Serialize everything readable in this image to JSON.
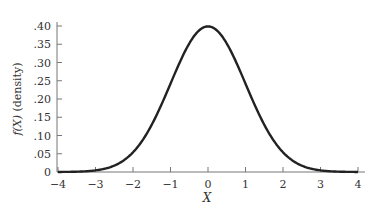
{
  "chart_data": {
    "type": "line",
    "title": "",
    "xlabel": "X",
    "ylabel": "f(X) (density)",
    "xlim": [
      -4,
      4
    ],
    "ylim": [
      0,
      0.4
    ],
    "x_ticks": [
      "−4",
      "−3",
      "−2",
      "−1",
      "0",
      "1",
      "2",
      "3",
      "4"
    ],
    "y_ticks": [
      "0",
      ".05",
      ".10",
      ".15",
      ".20",
      ".25",
      ".30",
      ".35",
      ".40"
    ],
    "grid": false,
    "legend": null,
    "series": [
      {
        "name": "Standard normal density",
        "x": [
          -4,
          -3.5,
          -3,
          -2.5,
          -2,
          -1.5,
          -1,
          -0.5,
          0,
          0.5,
          1,
          1.5,
          2,
          2.5,
          3,
          3.5,
          4
        ],
        "values": [
          0.0001,
          0.0009,
          0.0044,
          0.0175,
          0.054,
          0.1295,
          0.242,
          0.3521,
          0.3989,
          0.3521,
          0.242,
          0.1295,
          0.054,
          0.0175,
          0.0044,
          0.0009,
          0.0001
        ]
      }
    ],
    "color": "#222222"
  },
  "labels": {
    "xlabel": "X",
    "ylabel_f": "f(X)",
    "ylabel_rest": " (density)"
  }
}
